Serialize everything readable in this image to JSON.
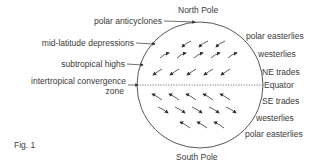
{
  "diagram": {
    "title": "Fig. 1",
    "top_label": "North Pole",
    "bottom_label": "South Pole",
    "left_labels": [
      {
        "id": "polar-anticyclones",
        "text": "polar anticyclones"
      },
      {
        "id": "mid-latitude-depressions",
        "text": "mid-latitude depressions"
      },
      {
        "id": "subtropical-highs",
        "text": "subtropical highs"
      },
      {
        "id": "itcz-line1",
        "text": "intertropical convergence"
      },
      {
        "id": "itcz-line2",
        "text": "zone"
      }
    ],
    "right_labels": [
      {
        "id": "polar-easterlies-north",
        "text": "polar easterlies"
      },
      {
        "id": "westerlies-north",
        "text": "westerlies"
      },
      {
        "id": "ne-trades",
        "text": "NE trades"
      },
      {
        "id": "equator",
        "text": "Equator"
      },
      {
        "id": "se-trades",
        "text": "SE trades"
      },
      {
        "id": "westerlies-south",
        "text": "westerlies"
      },
      {
        "id": "polar-easterlies-south",
        "text": "polar easterlies"
      }
    ],
    "colors": {
      "line": "#333333",
      "text": "#3a3a3a",
      "background": "#ffffff"
    }
  }
}
